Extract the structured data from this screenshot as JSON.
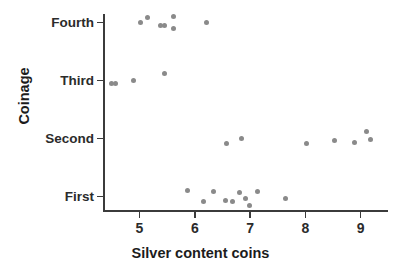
{
  "chart_data": {
    "type": "scatter",
    "title": "",
    "xlabel": "Silver content coins",
    "ylabel": "Coinage",
    "xlim": [
      4.35,
      9.5
    ],
    "ylim_categories": [
      "First",
      "Second",
      "Third",
      "Fourth"
    ],
    "grid": false,
    "legend": null,
    "point_color": "#8a8a8a",
    "axis_color": "#3b3b3b",
    "background": "#ffffff",
    "x_ticks": [
      {
        "value": 5,
        "label": "5"
      },
      {
        "value": 6,
        "label": "6"
      },
      {
        "value": 7,
        "label": "7"
      },
      {
        "value": 8,
        "label": "8"
      },
      {
        "value": 9,
        "label": "9"
      }
    ],
    "y_ticks": [
      {
        "value": "Fourth",
        "label": "Fourth"
      },
      {
        "value": "Third",
        "label": "Third"
      },
      {
        "value": "Second",
        "label": "Second"
      },
      {
        "value": "First",
        "label": "First"
      }
    ],
    "series": [
      {
        "name": "Fourth",
        "category": "Fourth",
        "values": [
          5.01,
          5.15,
          5.38,
          5.46,
          5.62,
          5.62,
          6.22
        ],
        "jitter": [
          0,
          -0.05,
          0.03,
          0.03,
          0.06,
          -0.06,
          0
        ]
      },
      {
        "name": "Third",
        "category": "Third",
        "values": [
          4.5,
          4.57,
          4.9,
          5.46
        ],
        "jitter": [
          0.03,
          0.03,
          0,
          -0.07
        ]
      },
      {
        "name": "Second",
        "category": "Second",
        "values": [
          6.57,
          6.85,
          8.02,
          8.52,
          8.88,
          9.1,
          9.18
        ],
        "jitter": [
          0.05,
          0,
          0.05,
          0.02,
          0.04,
          -0.07,
          0.01
        ]
      },
      {
        "name": "First",
        "category": "First",
        "values": [
          5.86,
          6.15,
          6.33,
          6.56,
          6.68,
          6.8,
          6.92,
          6.99,
          7.13,
          7.64
        ],
        "jitter": [
          -0.06,
          0.05,
          -0.05,
          0.04,
          0.05,
          -0.04,
          0.02,
          0.09,
          -0.05,
          0.02
        ]
      }
    ]
  }
}
